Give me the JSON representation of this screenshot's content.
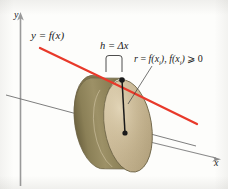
{
  "figure": {
    "background_color": "#fdfdfb"
  },
  "axes": {
    "x_label": "x",
    "y_label": "y",
    "axis_color": "#8a8a8a",
    "depth_axis_color": "#6f6f6f"
  },
  "curve": {
    "label_text": "y = f(x)",
    "label_lhs": "y",
    "label_eq": " = ",
    "label_rhs": "f(x)",
    "color": "#e8392a"
  },
  "annotations": {
    "height": {
      "var": "h",
      "eq": " = ",
      "delta": "Δ",
      "variable": "x",
      "full": "h = Δx"
    },
    "radius": {
      "var": "r",
      "eq": " = ",
      "expr_fn": "f(x",
      "sub": "i",
      "close": ")",
      "comma": ", ",
      "condition_fn": "f(x",
      "condition_sub": "i",
      "condition_close": ")",
      "geq": " ⩾ ",
      "zero": "0",
      "full": "r = f(xᵢ), f(xᵢ) ⩾ 0"
    }
  },
  "disk": {
    "front_face_color": "#c9b795",
    "rim_color": "#8f8458",
    "shadow_color": "#6f6540",
    "highlight_color": "#ded0b2",
    "outline_color": "#6d6346",
    "center_dot_color": "#1a1a1a",
    "top_dot_color": "#1a1a1a"
  }
}
